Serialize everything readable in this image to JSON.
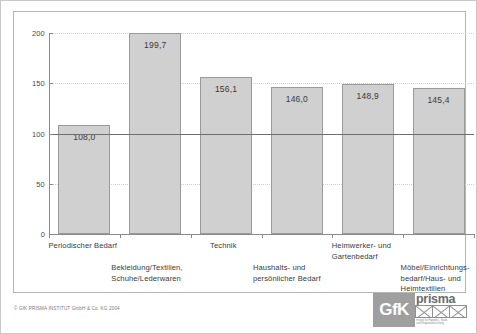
{
  "chart_data": {
    "type": "bar",
    "title": "",
    "subtitle": "",
    "xlabel": "",
    "ylabel": "",
    "ylim": [
      0,
      200
    ],
    "yticks": [
      0,
      50,
      100,
      150,
      200
    ],
    "ytick_labels": [
      "0",
      "50",
      "100",
      "150",
      "200"
    ],
    "grid": true,
    "legend": null,
    "reference_line": {
      "value": 100,
      "style": "solid",
      "color": "#6e6e6e"
    },
    "categories": [
      "Periodischer Bedarf",
      "Bekleidung/Textilien,\nSchuhe/Lederwaren",
      "Technik",
      "Haushalts- und\npersönlicher Bedarf",
      "Heimwerker- und\nGartenbedarf",
      "Möbel/Einrichtungs-\nbedarf/Haus- und\nHeimtextilien"
    ],
    "values": [
      108.0,
      199.7,
      156.1,
      146.0,
      148.9,
      145.4
    ],
    "value_labels": [
      "108,0",
      "199,7",
      "156,1",
      "146,0",
      "148,9",
      "145,4"
    ],
    "bar_color": "#d0d0d0",
    "bar_border_color": "#9a9a9a"
  },
  "footer": {
    "copyright": "© GfK PRISMA INSTITUT GmbH & Co. KG 2004"
  },
  "logo": {
    "gfk": "GfK",
    "prisma": "prisma",
    "tagline": "Institut für Handels-, Stadt-\nund Regionalforschung"
  }
}
